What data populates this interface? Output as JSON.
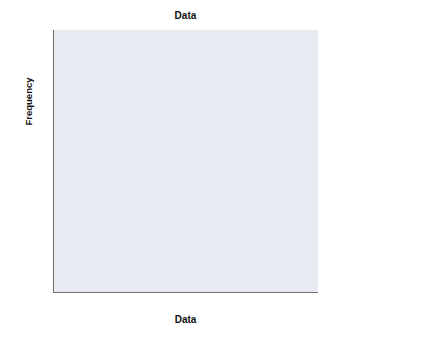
{
  "chart_data": {
    "type": "bar",
    "title": "Data",
    "xlabel": "Data",
    "ylabel": "Frequency",
    "xlim": [
      11.5,
      26.5
    ],
    "ylim": [
      0,
      72
    ],
    "grid": false,
    "legend": null,
    "bin_width": 1,
    "bin_starts": [
      13.5,
      14.5,
      15.5,
      16.5,
      17.5,
      18.5,
      19.5,
      20.5,
      21.5,
      22.5,
      23.5,
      24.5
    ],
    "bin_centers": [
      14,
      15,
      16,
      17,
      18,
      19,
      20,
      21,
      22,
      23,
      24,
      25
    ],
    "categories": [
      "14",
      "15",
      "16",
      "17",
      "18",
      "19",
      "20",
      "21",
      "22",
      "23",
      "24",
      "25"
    ],
    "values": [
      2,
      3,
      12,
      20,
      36,
      63,
      46,
      35,
      21,
      8,
      3,
      1
    ],
    "xticks": [
      12.5,
      15.0,
      17.5,
      20.0,
      22.5,
      25.0
    ],
    "xtick_labels": [
      "12.50",
      "15.00",
      "17.50",
      "20.00",
      "22.50",
      "25.00"
    ],
    "yticks": [
      0,
      20,
      40,
      60
    ],
    "ytick_labels": [
      "0",
      "20",
      "40",
      "60"
    ],
    "annotations": [
      "Mean = 19.39",
      "Std. Dev. = 1.899",
      "N = 250"
    ],
    "colors": {
      "bar_fill": "#7fa6d4",
      "bar_border": "#33527c",
      "plot_background": "#e7ebf1",
      "axis": "#6f6f6f",
      "text": "#111111",
      "figure_background": "#ffffff"
    }
  }
}
